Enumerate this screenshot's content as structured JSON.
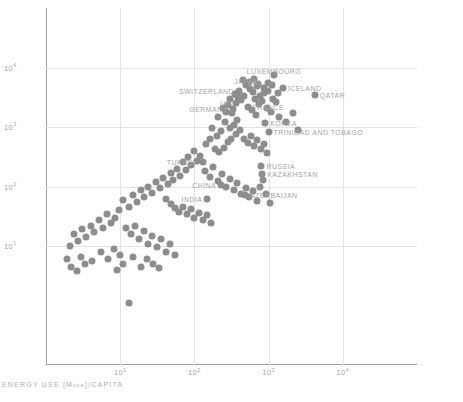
{
  "chart_data": {
    "type": "scatter",
    "title": "",
    "xlabel": "ENERGY USE [Mtoe]/CAPITA",
    "ylabel": "GDP [BILLION 2000US]/CAPITA",
    "xscale": "log",
    "yscale": "log",
    "xlim": [
      1,
      100000
    ],
    "ylim": [
      0.1,
      100000
    ],
    "grid": true,
    "legend": "none",
    "xticks": [
      {
        "value": 10,
        "label": "10",
        "exp": "1"
      },
      {
        "value": 100,
        "label": "10",
        "exp": "2"
      },
      {
        "value": 1000,
        "label": "10",
        "exp": "3"
      },
      {
        "value": 10000,
        "label": "10",
        "exp": "4"
      }
    ],
    "yticks": [
      {
        "value": 10000,
        "label": "10",
        "exp": "4"
      },
      {
        "value": 1000,
        "label": "10",
        "exp": "3"
      },
      {
        "value": 100,
        "label": "10",
        "exp": "2"
      },
      {
        "value": 10,
        "label": "10",
        "exp": "1"
      }
    ],
    "marker": {
      "color": "#8d8d8d",
      "size": 7,
      "shape": "circle"
    },
    "labeled_points": [
      {
        "name": "LUXEMBOURG",
        "x": 1180,
        "y": 7600,
        "anchor": "above"
      },
      {
        "name": "ICELAND",
        "x": 1560,
        "y": 4600,
        "anchor": "right"
      },
      {
        "name": "USA",
        "x": 980,
        "y": 5500,
        "anchor": "left"
      },
      {
        "name": "QATAR",
        "x": 4200,
        "y": 3400,
        "anchor": "right"
      },
      {
        "name": "JAPAN",
        "x": 500,
        "y": 5100,
        "anchor": "above"
      },
      {
        "name": "SWITZERLAND",
        "x": 400,
        "y": 4100,
        "anchor": "left"
      },
      {
        "name": "FRANCE",
        "x": 520,
        "y": 2200,
        "anchor": "right"
      },
      {
        "name": "UK",
        "x": 360,
        "y": 2500,
        "anchor": "left"
      },
      {
        "name": "GERMANY",
        "x": 330,
        "y": 2000,
        "anchor": "left"
      },
      {
        "name": "KOREA",
        "x": 900,
        "y": 1150,
        "anchor": "right"
      },
      {
        "name": "TRINIDAD AND TOBAGO",
        "x": 1000,
        "y": 820,
        "anchor": "right"
      },
      {
        "name": "RUSSIA",
        "x": 800,
        "y": 220,
        "anchor": "right"
      },
      {
        "name": "KAZAKHSTAN",
        "x": 820,
        "y": 160,
        "anchor": "right"
      },
      {
        "name": "TURKEY",
        "x": 130,
        "y": 260,
        "anchor": "left"
      },
      {
        "name": "CHINA",
        "x": 230,
        "y": 105,
        "anchor": "left"
      },
      {
        "name": "AZERBAIJAN",
        "x": 480,
        "y": 72,
        "anchor": "right"
      },
      {
        "name": "INDIA",
        "x": 150,
        "y": 62,
        "anchor": "left"
      }
    ],
    "points": [
      [
        1180,
        7600
      ],
      [
        1560,
        4600
      ],
      [
        980,
        5500
      ],
      [
        4200,
        3400
      ],
      [
        500,
        5100
      ],
      [
        400,
        4100
      ],
      [
        520,
        2200
      ],
      [
        360,
        2500
      ],
      [
        330,
        2000
      ],
      [
        900,
        1150
      ],
      [
        1000,
        820
      ],
      [
        800,
        220
      ],
      [
        820,
        160
      ],
      [
        130,
        260
      ],
      [
        230,
        105
      ],
      [
        480,
        72
      ],
      [
        150,
        62
      ],
      [
        700,
        4800
      ],
      [
        620,
        3900
      ],
      [
        560,
        4400
      ],
      [
        760,
        3300
      ],
      [
        880,
        3700
      ],
      [
        660,
        2900
      ],
      [
        470,
        3300
      ],
      [
        430,
        2800
      ],
      [
        390,
        3200
      ],
      [
        350,
        3600
      ],
      [
        300,
        2900
      ],
      [
        280,
        2300
      ],
      [
        320,
        1700
      ],
      [
        270,
        1800
      ],
      [
        240,
        2100
      ],
      [
        210,
        1500
      ],
      [
        600,
        1900
      ],
      [
        680,
        1600
      ],
      [
        740,
        2400
      ],
      [
        820,
        2700
      ],
      [
        940,
        2100
      ],
      [
        1080,
        1800
      ],
      [
        1260,
        2600
      ],
      [
        1400,
        1500
      ],
      [
        1700,
        1200
      ],
      [
        2100,
        1700
      ],
      [
        2500,
        900
      ],
      [
        1150,
        3000
      ],
      [
        1350,
        3800
      ],
      [
        860,
        4600
      ],
      [
        540,
        5600
      ],
      [
        450,
        6100
      ],
      [
        640,
        6400
      ],
      [
        720,
        5200
      ],
      [
        990,
        4100
      ],
      [
        1100,
        5100
      ],
      [
        380,
        1300
      ],
      [
        340,
        1100
      ],
      [
        300,
        980
      ],
      [
        260,
        1200
      ],
      [
        230,
        850
      ],
      [
        200,
        700
      ],
      [
        175,
        950
      ],
      [
        160,
        620
      ],
      [
        145,
        520
      ],
      [
        190,
        420
      ],
      [
        215,
        380
      ],
      [
        250,
        450
      ],
      [
        285,
        560
      ],
      [
        310,
        640
      ],
      [
        360,
        760
      ],
      [
        410,
        880
      ],
      [
        470,
        640
      ],
      [
        520,
        540
      ],
      [
        580,
        700
      ],
      [
        640,
        480
      ],
      [
        700,
        600
      ],
      [
        780,
        420
      ],
      [
        860,
        520
      ],
      [
        950,
        360
      ],
      [
        120,
        330
      ],
      [
        108,
        270
      ],
      [
        98,
        400
      ],
      [
        90,
        230
      ],
      [
        82,
        310
      ],
      [
        76,
        190
      ],
      [
        70,
        260
      ],
      [
        64,
        150
      ],
      [
        58,
        200
      ],
      [
        52,
        130
      ],
      [
        48,
        170
      ],
      [
        44,
        110
      ],
      [
        140,
        180
      ],
      [
        160,
        145
      ],
      [
        180,
        215
      ],
      [
        205,
        125
      ],
      [
        235,
        160
      ],
      [
        270,
        100
      ],
      [
        300,
        135
      ],
      [
        340,
        88
      ],
      [
        380,
        115
      ],
      [
        430,
        76
      ],
      [
        490,
        95
      ],
      [
        550,
        66
      ],
      [
        620,
        84
      ],
      [
        690,
        58
      ],
      [
        760,
        100
      ],
      [
        840,
        130
      ],
      [
        930,
        74
      ],
      [
        1030,
        52
      ],
      [
        38,
        140
      ],
      [
        34,
        95
      ],
      [
        30,
        120
      ],
      [
        27,
        78
      ],
      [
        24,
        100
      ],
      [
        21,
        66
      ],
      [
        19,
        88
      ],
      [
        17,
        55
      ],
      [
        15,
        72
      ],
      [
        13,
        46
      ],
      [
        11,
        60
      ],
      [
        9.5,
        40
      ],
      [
        42,
        62
      ],
      [
        48,
        50
      ],
      [
        55,
        44
      ],
      [
        62,
        38
      ],
      [
        70,
        46
      ],
      [
        80,
        34
      ],
      [
        90,
        42
      ],
      [
        100,
        30
      ],
      [
        115,
        36
      ],
      [
        130,
        27
      ],
      [
        148,
        33
      ],
      [
        168,
        24
      ],
      [
        8.5,
        30
      ],
      [
        7.5,
        24
      ],
      [
        6.6,
        35
      ],
      [
        5.8,
        20
      ],
      [
        5.1,
        27
      ],
      [
        4.5,
        17
      ],
      [
        4.0,
        22
      ],
      [
        3.5,
        14
      ],
      [
        3.1,
        19
      ],
      [
        2.7,
        12
      ],
      [
        2.4,
        16
      ],
      [
        2.1,
        10
      ],
      [
        12,
        20
      ],
      [
        14,
        16
      ],
      [
        16,
        22
      ],
      [
        18,
        13
      ],
      [
        21,
        18
      ],
      [
        24,
        11
      ],
      [
        27,
        15
      ],
      [
        31,
        9.5
      ],
      [
        36,
        13
      ],
      [
        41,
        8
      ],
      [
        47,
        11
      ],
      [
        54,
        7
      ],
      [
        3.0,
        6.5
      ],
      [
        4.2,
        5.5
      ],
      [
        5.5,
        8
      ],
      [
        6.8,
        6
      ],
      [
        8.2,
        9
      ],
      [
        10,
        7
      ],
      [
        2.2,
        4.5
      ],
      [
        1.9,
        6
      ],
      [
        2.6,
        3.8
      ],
      [
        3.4,
        5
      ],
      [
        13,
        1.1
      ],
      [
        9,
        4
      ],
      [
        11,
        5
      ],
      [
        15,
        6.5
      ],
      [
        19,
        4.5
      ],
      [
        23,
        6
      ],
      [
        28,
        5
      ],
      [
        33,
        4.2
      ]
    ]
  }
}
